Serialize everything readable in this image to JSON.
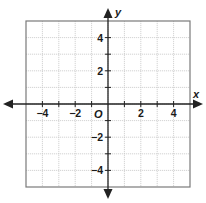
{
  "chart_data": {
    "type": "coordinate-grid",
    "title": "",
    "xlabel": "x",
    "ylabel": "y",
    "origin_label": "O",
    "xlim": [
      -5,
      5
    ],
    "ylim": [
      -5,
      5
    ],
    "grid": true,
    "grid_step": 1,
    "x_tick_labels": [
      {
        "value": -4,
        "label": "−4"
      },
      {
        "value": -2,
        "label": "−2"
      },
      {
        "value": 2,
        "label": "2"
      },
      {
        "value": 4,
        "label": "4"
      }
    ],
    "y_tick_labels": [
      {
        "value": 4,
        "label": "4"
      },
      {
        "value": 2,
        "label": "2"
      },
      {
        "value": -2,
        "label": "−2"
      },
      {
        "value": -4,
        "label": "−4"
      }
    ],
    "axes_arrows": true
  },
  "colors": {
    "grid": "#c8c8c8",
    "frame": "#7a7a7a",
    "axis": "#222222",
    "text": "#1a1a1a"
  }
}
